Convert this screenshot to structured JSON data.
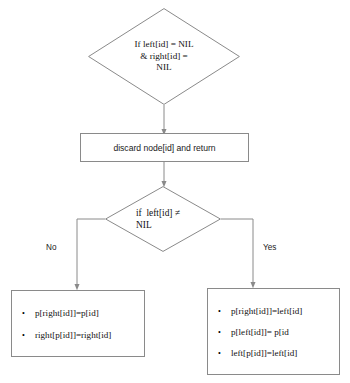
{
  "diagram": {
    "type": "flowchart",
    "background_color": "#ffffff",
    "stroke_color": "#8a8a8a",
    "text_color": "#111111",
    "nodes": {
      "root_decision": {
        "shape": "diamond",
        "lines": [
          "If left[id] = NIL",
          "& right[id] =",
          "NIL"
        ]
      },
      "discard_action": {
        "shape": "rectangle",
        "label": "discard node[id] and return"
      },
      "left_check_decision": {
        "shape": "diamond",
        "lines": [
          "if  left[id] ≠",
          "NIL"
        ]
      },
      "no_box": {
        "shape": "rectangle",
        "bullet_char": "•",
        "items": [
          "p[right[id]]=p[id]",
          "right[p[id]]=right[id]"
        ]
      },
      "yes_box": {
        "shape": "rectangle",
        "bullet_char": "•",
        "items": [
          "p[right[id]]=left[id]",
          "p[left[id]]= p[id",
          "left[p[id]]=left[id]"
        ]
      }
    },
    "branch_labels": {
      "no": "No",
      "yes": "Yes"
    }
  }
}
